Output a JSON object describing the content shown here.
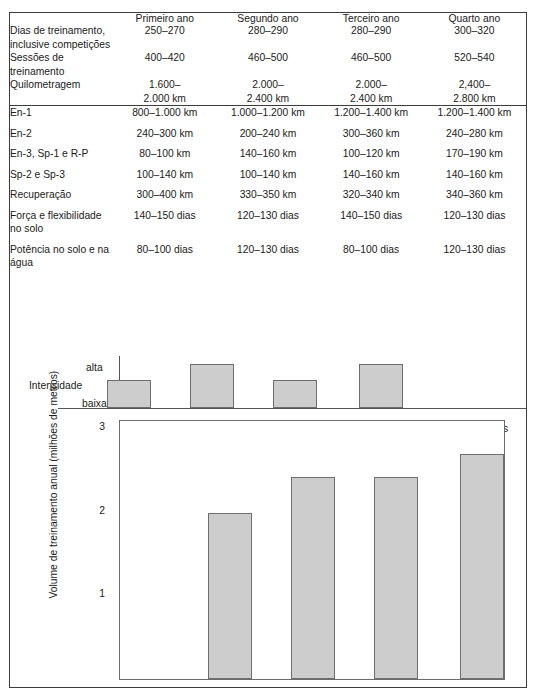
{
  "figure": {
    "table": {
      "row_header_blank": "",
      "columns": [
        "Primeiro ano",
        "Segundo ano",
        "Terceiro ano",
        "Quarto ano"
      ],
      "rows": [
        {
          "label": "Dias de treinamento,\ninclusive competições",
          "values": [
            "250–270",
            "280–290",
            "280–290",
            "300–320"
          ],
          "rule_above": false
        },
        {
          "label": "Sessões de treinamento",
          "values": [
            "400–420",
            "460–500",
            "460–500",
            "520–540"
          ],
          "rule_above": false
        },
        {
          "label": "Quilometragem",
          "values": [
            "1.600–\n2.000 km",
            "2.000–\n2.400 km",
            "2.000–\n2.400 km",
            "2,400–\n2.800 km"
          ],
          "rule_above": false
        },
        {
          "label": "En-1",
          "values": [
            "800–1.000 km",
            "1.000–1.200 km",
            "1.200–1.400 km",
            "1.200–1.400 km"
          ],
          "rule_above": true
        },
        {
          "label": "En-2",
          "values": [
            "240–300 km",
            "200–240 km",
            "300–360 km",
            "240–280 km"
          ],
          "rule_above": false
        },
        {
          "label": "En-3, Sp-1 e R-P",
          "values": [
            "80–100 km",
            "140–160 km",
            "100–120 km",
            "170–190 km"
          ],
          "rule_above": false
        },
        {
          "label": "Sp-2 e Sp-3",
          "values": [
            "100–140 km",
            "100–140 km",
            "140–160 km",
            "140–160 km"
          ],
          "rule_above": false
        },
        {
          "label": "Recuperação",
          "values": [
            "300–400 km",
            "330–350 km",
            "320–340 km",
            "340–360 km"
          ],
          "rule_above": false
        },
        {
          "label": "Força e flexibilidade no solo",
          "values": [
            "140–150 dias",
            "120–130 dias",
            "140–150 dias",
            "120–130 dias"
          ],
          "rule_above": false
        },
        {
          "label": "Potência no solo e na água",
          "values": [
            "80–100 dias",
            "120–130 dias",
            "80–100 dias",
            "120–130 dias"
          ],
          "rule_above": false
        }
      ]
    }
  },
  "chart_data": [
    {
      "type": "bar",
      "name": "intensidade",
      "title": "",
      "ylabel": "Intensidade",
      "categories": [
        "Primeiro ano",
        "Segundo ano",
        "Terceiro ano",
        "Quarto ano"
      ],
      "values": [
        0.58,
        0.92,
        0.58,
        0.92
      ],
      "ylim": [
        0,
        1
      ],
      "ytick_labels": [
        "baixa",
        "alta"
      ],
      "ytick_low": "baixa",
      "ytick_high": "alta",
      "grid": false,
      "legend": "none",
      "bar_color": "#cdcdcd",
      "bar_border": "#6e6e6e"
    },
    {
      "type": "bar",
      "name": "volume-de-treinamento",
      "title": "",
      "xlabel": "",
      "ylabel": "Volume de treinamento anual (milhões de metros)",
      "categories": [
        "Primeiro ano",
        "Segundo ano",
        "Terceiro ano",
        "Quarto ano"
      ],
      "values": [
        2.0,
        2.43,
        2.43,
        2.7
      ],
      "ylim": [
        0,
        3.1
      ],
      "ytick_values": [
        1,
        2,
        3
      ],
      "ytick_labels": [
        "1",
        "2",
        "3"
      ],
      "annotations": [
        {
          "text": "Campeonatos\nMundiais",
          "category_index": 1
        },
        {
          "text": "Jogos Olímpicos",
          "category_index": 3
        }
      ],
      "grid": false,
      "legend": "none",
      "bar_color": "#cdcdcd",
      "bar_border": "#6e6e6e"
    }
  ]
}
